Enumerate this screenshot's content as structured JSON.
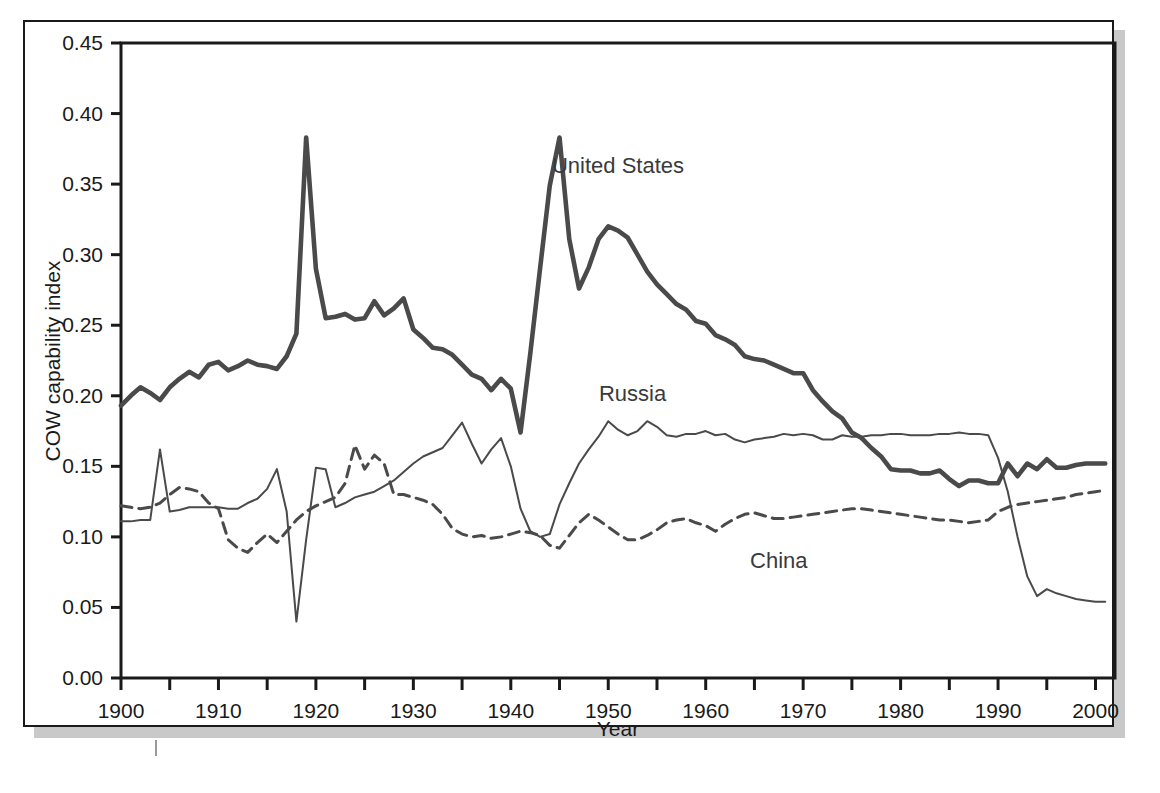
{
  "figure": {
    "background_color": "#ffffff",
    "frame_color": "#1a1a1a",
    "shadow_color": "#c9c9c9"
  },
  "chart_data": {
    "type": "line",
    "title": "",
    "xlabel": "Year",
    "ylabel": "COW capability index",
    "xlim": [
      1900,
      2002
    ],
    "ylim": [
      0.0,
      0.45
    ],
    "grid": false,
    "legend_position": "inline-annotations",
    "x_ticks_major": [
      1900,
      1910,
      1920,
      1930,
      1940,
      1950,
      1960,
      1970,
      1980,
      1990,
      2000
    ],
    "x_tick_labels": [
      "1900",
      "1910",
      "1920",
      "1930",
      "1940",
      "1950",
      "1960",
      "1970",
      "1980",
      "1990",
      "2000"
    ],
    "x_ticks_minor": [
      1905,
      1915,
      1925,
      1935,
      1945,
      1955,
      1965,
      1975,
      1985,
      1995
    ],
    "y_ticks": [
      0.0,
      0.05,
      0.1,
      0.15,
      0.2,
      0.25,
      0.3,
      0.35,
      0.4,
      0.45
    ],
    "y_tick_labels": [
      "0.00",
      "0.05",
      "0.10",
      "0.15",
      "0.20",
      "0.25",
      "0.30",
      "0.35",
      "0.40",
      "0.45"
    ],
    "annotations": [
      {
        "text": "United States",
        "x": 1951.0,
        "y": 0.358
      },
      {
        "text": "Russia",
        "x": 1952.5,
        "y": 0.196
      },
      {
        "text": "China",
        "x": 1967.5,
        "y": 0.078
      }
    ],
    "series": [
      {
        "name": "United States",
        "style": "solid",
        "linewidth": 4.6,
        "color": "#4a4a4a",
        "x": [
          1900,
          1901,
          1902,
          1903,
          1904,
          1905,
          1906,
          1907,
          1908,
          1909,
          1910,
          1911,
          1912,
          1913,
          1914,
          1915,
          1916,
          1917,
          1918,
          1919,
          1920,
          1921,
          1922,
          1923,
          1924,
          1925,
          1926,
          1927,
          1928,
          1929,
          1930,
          1931,
          1932,
          1933,
          1934,
          1935,
          1936,
          1937,
          1938,
          1939,
          1940,
          1941,
          1942,
          1943,
          1944,
          1945,
          1946,
          1947,
          1948,
          1949,
          1950,
          1951,
          1952,
          1953,
          1954,
          1955,
          1956,
          1957,
          1958,
          1959,
          1960,
          1961,
          1962,
          1963,
          1964,
          1965,
          1966,
          1967,
          1968,
          1969,
          1970,
          1971,
          1972,
          1973,
          1974,
          1975,
          1976,
          1977,
          1978,
          1979,
          1980,
          1981,
          1982,
          1983,
          1984,
          1985,
          1986,
          1987,
          1988,
          1989,
          1990,
          1991,
          1992,
          1993,
          1994,
          1995,
          1996,
          1997,
          1998,
          1999,
          2000,
          2001
        ],
        "values": [
          0.193,
          0.2,
          0.206,
          0.202,
          0.197,
          0.206,
          0.212,
          0.217,
          0.213,
          0.222,
          0.224,
          0.218,
          0.221,
          0.225,
          0.222,
          0.221,
          0.219,
          0.228,
          0.244,
          0.383,
          0.29,
          0.255,
          0.256,
          0.258,
          0.254,
          0.255,
          0.267,
          0.257,
          0.262,
          0.269,
          0.247,
          0.241,
          0.234,
          0.233,
          0.229,
          0.222,
          0.215,
          0.212,
          0.204,
          0.212,
          0.205,
          0.174,
          0.23,
          0.29,
          0.349,
          0.383,
          0.311,
          0.276,
          0.291,
          0.311,
          0.32,
          0.317,
          0.312,
          0.3,
          0.288,
          0.279,
          0.272,
          0.265,
          0.261,
          0.253,
          0.251,
          0.243,
          0.24,
          0.236,
          0.228,
          0.226,
          0.225,
          0.222,
          0.219,
          0.216,
          0.216,
          0.204,
          0.196,
          0.189,
          0.184,
          0.174,
          0.17,
          0.163,
          0.157,
          0.148,
          0.147,
          0.147,
          0.145,
          0.145,
          0.147,
          0.141,
          0.136,
          0.14,
          0.14,
          0.138,
          0.138,
          0.152,
          0.143,
          0.152,
          0.148,
          0.155,
          0.149,
          0.149,
          0.151,
          0.152,
          0.152,
          0.152
        ]
      },
      {
        "name": "Russia",
        "style": "solid",
        "linewidth": 2.0,
        "color": "#4a4a4a",
        "x": [
          1900,
          1901,
          1902,
          1903,
          1904,
          1905,
          1906,
          1907,
          1908,
          1909,
          1910,
          1911,
          1912,
          1913,
          1914,
          1915,
          1916,
          1917,
          1918,
          1919,
          1920,
          1921,
          1922,
          1923,
          1924,
          1925,
          1926,
          1927,
          1928,
          1929,
          1930,
          1931,
          1932,
          1933,
          1934,
          1935,
          1936,
          1937,
          1938,
          1939,
          1940,
          1941,
          1942,
          1943,
          1944,
          1945,
          1946,
          1947,
          1948,
          1949,
          1950,
          1951,
          1952,
          1953,
          1954,
          1955,
          1956,
          1957,
          1958,
          1959,
          1960,
          1961,
          1962,
          1963,
          1964,
          1965,
          1966,
          1967,
          1968,
          1969,
          1970,
          1971,
          1972,
          1973,
          1974,
          1975,
          1976,
          1977,
          1978,
          1979,
          1980,
          1981,
          1982,
          1983,
          1984,
          1985,
          1986,
          1987,
          1988,
          1989,
          1990,
          1991,
          1992,
          1993,
          1994,
          1995,
          1996,
          1997,
          1998,
          1999,
          2000,
          2001
        ],
        "values": [
          0.111,
          0.111,
          0.112,
          0.112,
          0.162,
          0.118,
          0.119,
          0.121,
          0.121,
          0.121,
          0.121,
          0.12,
          0.12,
          0.124,
          0.127,
          0.134,
          0.148,
          0.118,
          0.04,
          0.098,
          0.149,
          0.148,
          0.121,
          0.124,
          0.128,
          0.13,
          0.132,
          0.136,
          0.14,
          0.146,
          0.152,
          0.157,
          0.16,
          0.163,
          0.172,
          0.181,
          0.166,
          0.152,
          0.162,
          0.17,
          0.15,
          0.12,
          0.104,
          0.1,
          0.102,
          0.123,
          0.138,
          0.152,
          0.162,
          0.171,
          0.182,
          0.176,
          0.172,
          0.175,
          0.182,
          0.178,
          0.172,
          0.171,
          0.173,
          0.173,
          0.175,
          0.172,
          0.173,
          0.169,
          0.167,
          0.169,
          0.17,
          0.171,
          0.173,
          0.172,
          0.173,
          0.172,
          0.169,
          0.169,
          0.172,
          0.171,
          0.171,
          0.172,
          0.172,
          0.173,
          0.173,
          0.172,
          0.172,
          0.172,
          0.173,
          0.173,
          0.174,
          0.173,
          0.173,
          0.172,
          0.156,
          0.132,
          0.1,
          0.072,
          0.058,
          0.063,
          0.06,
          0.058,
          0.056,
          0.055,
          0.054,
          0.054
        ]
      },
      {
        "name": "China",
        "style": "dashed",
        "linewidth": 3.0,
        "color": "#4a4a4a",
        "x": [
          1900,
          1901,
          1902,
          1903,
          1904,
          1905,
          1906,
          1907,
          1908,
          1909,
          1910,
          1911,
          1912,
          1913,
          1914,
          1915,
          1916,
          1917,
          1918,
          1919,
          1920,
          1921,
          1922,
          1923,
          1924,
          1925,
          1926,
          1927,
          1928,
          1929,
          1930,
          1931,
          1932,
          1933,
          1934,
          1935,
          1936,
          1937,
          1938,
          1939,
          1940,
          1941,
          1942,
          1943,
          1944,
          1945,
          1946,
          1947,
          1948,
          1949,
          1950,
          1951,
          1952,
          1953,
          1954,
          1955,
          1956,
          1957,
          1958,
          1959,
          1960,
          1961,
          1962,
          1963,
          1964,
          1965,
          1966,
          1967,
          1968,
          1969,
          1970,
          1971,
          1972,
          1973,
          1974,
          1975,
          1976,
          1977,
          1978,
          1979,
          1980,
          1981,
          1982,
          1983,
          1984,
          1985,
          1986,
          1987,
          1988,
          1989,
          1990,
          1991,
          1992,
          1993,
          1994,
          1995,
          1996,
          1997,
          1998,
          1999,
          2000,
          2001
        ],
        "values": [
          0.122,
          0.121,
          0.12,
          0.121,
          0.124,
          0.13,
          0.135,
          0.134,
          0.132,
          0.124,
          0.12,
          0.098,
          0.092,
          0.089,
          0.096,
          0.102,
          0.096,
          0.104,
          0.112,
          0.118,
          0.122,
          0.125,
          0.128,
          0.138,
          0.165,
          0.148,
          0.158,
          0.152,
          0.13,
          0.13,
          0.128,
          0.126,
          0.123,
          0.116,
          0.106,
          0.102,
          0.1,
          0.101,
          0.099,
          0.1,
          0.102,
          0.104,
          0.103,
          0.101,
          0.094,
          0.092,
          0.101,
          0.11,
          0.116,
          0.112,
          0.107,
          0.102,
          0.098,
          0.098,
          0.101,
          0.105,
          0.11,
          0.112,
          0.113,
          0.11,
          0.108,
          0.104,
          0.109,
          0.113,
          0.116,
          0.117,
          0.115,
          0.113,
          0.113,
          0.114,
          0.115,
          0.116,
          0.117,
          0.118,
          0.119,
          0.12,
          0.12,
          0.119,
          0.118,
          0.117,
          0.116,
          0.115,
          0.114,
          0.113,
          0.112,
          0.112,
          0.111,
          0.11,
          0.111,
          0.112,
          0.118,
          0.121,
          0.123,
          0.124,
          0.125,
          0.126,
          0.127,
          0.128,
          0.13,
          0.131,
          0.132,
          0.133
        ]
      }
    ]
  }
}
